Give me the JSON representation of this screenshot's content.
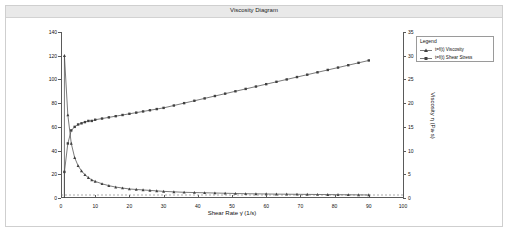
{
  "window": {
    "title": "Viscosity Diagram"
  },
  "legend": {
    "title": "Legend",
    "items": [
      {
        "label": "t=f(t) Viscosity",
        "color": "#404040",
        "marker": "triangle"
      },
      {
        "label": "t=f(t) Shear Stress",
        "color": "#404040",
        "marker": "square"
      }
    ]
  },
  "chart_data": {
    "type": "line",
    "title": "Viscosity Diagram",
    "xlabel": "Shear Rate γ̇ (1/s)",
    "ylabel": "Shear Stress τ (Pa)",
    "ylabel_right": "Viscosity η (Pa·s)",
    "xlim": [
      0,
      100
    ],
    "ylim": [
      0,
      140
    ],
    "ylim_right": [
      0,
      35
    ],
    "grid": false,
    "xticks": [
      0,
      10,
      20,
      30,
      40,
      50,
      60,
      70,
      80,
      90,
      100
    ],
    "yticks": [
      0,
      20,
      40,
      60,
      80,
      100,
      120,
      140
    ],
    "yticks_right": [
      0,
      5,
      10,
      15,
      20,
      25,
      30,
      35
    ],
    "series": [
      {
        "name": "t=f(t) Shear Stress",
        "axis": "left",
        "color": "#404040",
        "marker": "square",
        "x": [
          1,
          2,
          3,
          4,
          5,
          6,
          7,
          8,
          9,
          10,
          12,
          14,
          16,
          18,
          20,
          22,
          24,
          26,
          28,
          30,
          33,
          36,
          39,
          42,
          45,
          48,
          51,
          54,
          57,
          60,
          63,
          66,
          69,
          72,
          75,
          78,
          81,
          84,
          87,
          90
        ],
        "y": [
          22,
          46,
          57,
          60,
          62,
          63,
          64,
          65,
          65,
          66,
          67,
          68,
          69,
          70,
          71,
          72,
          73,
          74,
          75,
          76,
          78,
          80,
          82,
          84,
          86,
          88,
          90,
          92,
          94,
          96,
          98,
          100,
          102,
          104,
          106,
          108,
          110,
          112,
          114,
          116
        ]
      },
      {
        "name": "t=f(t) Viscosity",
        "axis": "right",
        "color": "#404040",
        "marker": "triangle",
        "x": [
          1,
          2,
          3,
          4,
          5,
          6,
          7,
          8,
          9,
          10,
          12,
          14,
          16,
          18,
          20,
          22,
          24,
          26,
          28,
          30,
          33,
          36,
          39,
          42,
          45,
          48,
          51,
          54,
          57,
          60,
          63,
          66,
          69,
          72,
          75,
          78,
          81,
          84,
          87,
          90
        ],
        "y": [
          30.0,
          17.5,
          11.5,
          8.5,
          6.8,
          5.7,
          4.9,
          4.3,
          3.8,
          3.5,
          3.0,
          2.6,
          2.3,
          2.1,
          1.9,
          1.8,
          1.7,
          1.6,
          1.5,
          1.4,
          1.3,
          1.2,
          1.15,
          1.1,
          1.05,
          1.0,
          0.95,
          0.9,
          0.88,
          0.85,
          0.82,
          0.8,
          0.78,
          0.76,
          0.74,
          0.72,
          0.7,
          0.68,
          0.66,
          0.64
        ]
      }
    ]
  }
}
